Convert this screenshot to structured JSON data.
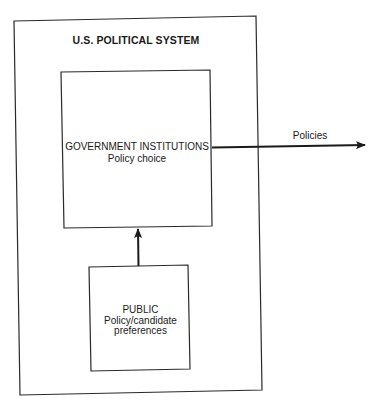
{
  "diagram": {
    "outer_box": {
      "title": "U.S. POLITICAL SYSTEM"
    },
    "government_box": {
      "title": "GOVERNMENT INSTITUTIONS",
      "subtitle": "Policy choice"
    },
    "public_box": {
      "title": "PUBLIC",
      "line2": "Policy/candidate",
      "line3": "preferences"
    },
    "output_arrow": {
      "label": "Policies"
    },
    "edges": [
      {
        "from": "public_box",
        "to": "government_box",
        "direction": "up"
      },
      {
        "from": "government_box",
        "to": "outside",
        "label": "Policies",
        "direction": "right"
      }
    ],
    "colors": {
      "line": "#2a2a2a",
      "background": "#ffffff"
    }
  }
}
